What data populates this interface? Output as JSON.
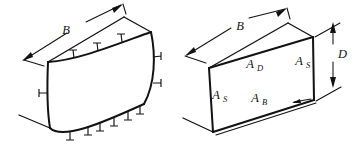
{
  "figure": {
    "background_color": "#ffffff",
    "line_color": "#121212",
    "panels": [
      {
        "id": "left",
        "name": "deformed-pressurized-duct",
        "caption": "",
        "labels": [
          {
            "key": "width",
            "text": "B",
            "sub": ""
          }
        ],
        "load_tick_count": 14
      },
      {
        "id": "right",
        "name": "idealized-duct-with-panel-areas",
        "caption": "",
        "labels": [
          {
            "key": "width",
            "text": "B",
            "sub": ""
          },
          {
            "key": "depth",
            "text": "D",
            "sub": ""
          },
          {
            "key": "top_panel",
            "text": "A",
            "sub": "D"
          },
          {
            "key": "side_panel_right",
            "text": "A",
            "sub": "S"
          },
          {
            "key": "side_panel_left",
            "text": "A",
            "sub": "S"
          },
          {
            "key": "bottom_panel",
            "text": "A",
            "sub": "B"
          }
        ]
      }
    ]
  },
  "labels": {
    "left_B": "B",
    "right_B": "B",
    "right_D": "D",
    "A": "A",
    "sub_D": "D",
    "sub_S": "S",
    "sub_B": "B"
  }
}
